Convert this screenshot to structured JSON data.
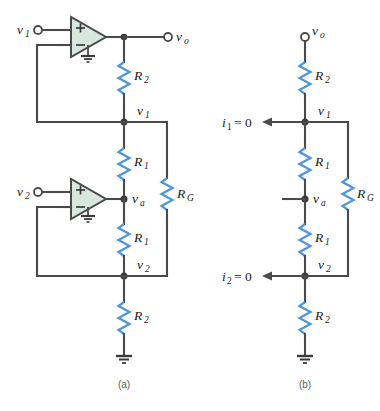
{
  "figure": {
    "captions": {
      "a": "(a)",
      "b": "(b)"
    },
    "colors": {
      "wire": "#4a4a4a",
      "resistor": "#4e95d9",
      "opamp_fill": "#d7e8df",
      "node": "#3a3a3a",
      "background": "#ffffff",
      "caption_text": "#5a5a5a"
    }
  },
  "circuit_a": {
    "name": "(a)",
    "terminals": [
      {
        "id": "v1-input",
        "label": "v",
        "sub": "1",
        "role": "input"
      },
      {
        "id": "v2-input",
        "label": "v",
        "sub": "2",
        "role": "input"
      },
      {
        "id": "vo-output",
        "label": "v",
        "sub": "o",
        "role": "output"
      }
    ],
    "opamps": [
      {
        "id": "opamp-top",
        "plus": "+",
        "minus": "−",
        "input_label": "v",
        "input_sub": "1"
      },
      {
        "id": "opamp-bottom",
        "plus": "+",
        "minus": "−",
        "input_label": "v",
        "input_sub": "2"
      }
    ],
    "resistors": [
      {
        "id": "r2-top",
        "label": "R",
        "sub": "2"
      },
      {
        "id": "r1-upper",
        "label": "R",
        "sub": "1"
      },
      {
        "id": "r1-lower",
        "label": "R",
        "sub": "1"
      },
      {
        "id": "r2-bottom",
        "label": "R",
        "sub": "2"
      },
      {
        "id": "rg",
        "label": "R",
        "sub": "G"
      }
    ],
    "nodes": [
      {
        "id": "node-v1",
        "label": "v",
        "sub": "1"
      },
      {
        "id": "node-va",
        "label": "v",
        "sub": "a"
      },
      {
        "id": "node-v2",
        "label": "v",
        "sub": "2"
      }
    ],
    "grounds": 3
  },
  "circuit_b": {
    "name": "(b)",
    "terminals": [
      {
        "id": "vo-output",
        "label": "v",
        "sub": "o",
        "role": "output"
      }
    ],
    "resistors": [
      {
        "id": "r2-top",
        "label": "R",
        "sub": "2"
      },
      {
        "id": "r1-upper",
        "label": "R",
        "sub": "1"
      },
      {
        "id": "r1-lower",
        "label": "R",
        "sub": "1"
      },
      {
        "id": "r2-bottom",
        "label": "R",
        "sub": "2"
      },
      {
        "id": "rg",
        "label": "R",
        "sub": "G"
      }
    ],
    "nodes": [
      {
        "id": "node-v1",
        "label": "v",
        "sub": "1"
      },
      {
        "id": "node-va",
        "label": "v",
        "sub": "a"
      },
      {
        "id": "node-v2",
        "label": "v",
        "sub": "2"
      }
    ],
    "currents": [
      {
        "id": "i1",
        "label": "i",
        "sub": "1",
        "equals": "= 0"
      },
      {
        "id": "i2",
        "label": "i",
        "sub": "2",
        "equals": "= 0"
      }
    ],
    "grounds": 1
  }
}
